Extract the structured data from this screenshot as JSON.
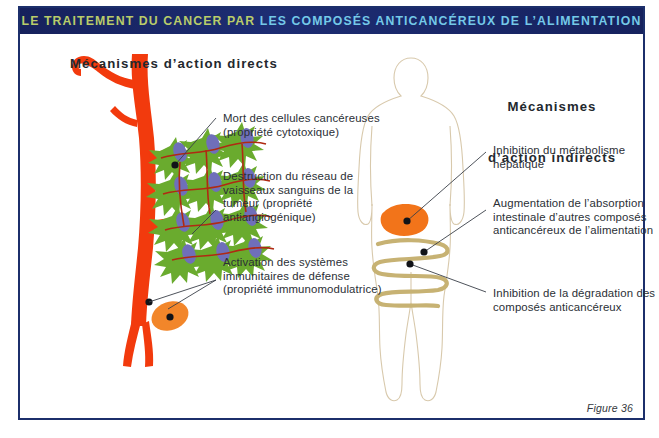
{
  "figure": {
    "title_part_highlight": "LE TRAITEMENT DU CANCER PAR ",
    "title_part_accent": "LES COMPOSÉS ANTICANCÉREUX DE L’ALIMENTATION",
    "caption": "Figure 36",
    "colors": {
      "frame": "#1c2f6b",
      "title_bar": "#16215c",
      "title_highlight": "#b9cc6a",
      "title_accent": "#74c9e8",
      "blood_vessel": "#f23a0d",
      "tumor_cell": "#6aab2e",
      "tumor_nucleus": "#6f6fba",
      "immune_cell": "#f2862a",
      "liver": "#f2741a",
      "intestine": "#c7b273",
      "body_outline": "#d8c9ac",
      "leader_line": "#3a3f48"
    }
  },
  "panels": {
    "left": {
      "heading": "Mécanismes d’action directs",
      "labels": [
        {
          "name": "cytotoxic",
          "text": "Mort des cellules cancéreuses (propriété cytotoxique)"
        },
        {
          "name": "antiangiogenic",
          "text": "Destruction du réseau de vaisseaux sanguins de la tumeur (propriété antiangiogénique)"
        },
        {
          "name": "immunomodulatory",
          "text": "Activation des systèmes immunitaires de défense (propriété immunomodulatrice)"
        }
      ]
    },
    "right": {
      "heading_line1": "Mécanismes",
      "heading_line2": "d’action indirects",
      "labels": [
        {
          "name": "hepatic-metabolism",
          "text": "Inhibition du métabolisme hépatique"
        },
        {
          "name": "intestinal-absorption",
          "text": "Augmentation de l’absorption intestinale d’autres composés anticancéreux de l’alimentation"
        },
        {
          "name": "compound-degradation",
          "text": "Inhibition de la dégradation des composés anticancéreux"
        }
      ]
    }
  }
}
